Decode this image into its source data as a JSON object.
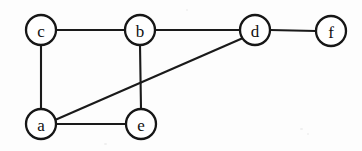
{
  "diagram": {
    "background_color": "#fdfdfd",
    "stroke_color": "#1a1a1a",
    "node_fill_color": "#ffffff",
    "node_radius": 15,
    "nodes": [
      {
        "id": "c",
        "label": "c",
        "x": 41,
        "y": 30
      },
      {
        "id": "b",
        "label": "b",
        "x": 140,
        "y": 30
      },
      {
        "id": "d",
        "label": "d",
        "x": 255,
        "y": 30
      },
      {
        "id": "f",
        "label": "f",
        "x": 331,
        "y": 31
      },
      {
        "id": "a",
        "label": "a",
        "x": 41,
        "y": 124
      },
      {
        "id": "e",
        "label": "e",
        "x": 141,
        "y": 124
      }
    ],
    "edges": [
      {
        "id": "c-b",
        "from": "c",
        "to": "b",
        "x1": 56,
        "y1": 30,
        "x2": 125,
        "y2": 30
      },
      {
        "id": "b-d",
        "from": "b",
        "to": "d",
        "x1": 155,
        "y1": 30,
        "x2": 240,
        "y2": 30
      },
      {
        "id": "d-f",
        "from": "d",
        "to": "f",
        "x1": 270,
        "y1": 30,
        "x2": 316,
        "y2": 31
      },
      {
        "id": "c-a",
        "from": "c",
        "to": "a",
        "x1": 41,
        "y1": 45,
        "x2": 41,
        "y2": 109
      },
      {
        "id": "b-e",
        "from": "b",
        "to": "e",
        "x1": 140,
        "y1": 45,
        "x2": 141,
        "y2": 109
      },
      {
        "id": "a-e",
        "from": "a",
        "to": "e",
        "x1": 56,
        "y1": 124,
        "x2": 126,
        "y2": 124
      },
      {
        "id": "a-d",
        "from": "a",
        "to": "d",
        "x1": 55,
        "y1": 120,
        "x2": 243,
        "y2": 38
      }
    ]
  }
}
